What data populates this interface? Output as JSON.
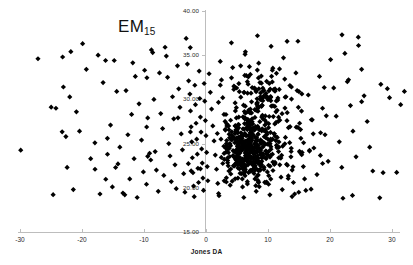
{
  "chart_data": {
    "type": "scatter",
    "title": "EM15",
    "title_base": "EM",
    "title_sub": "15",
    "xlabel": "Jones DA",
    "ylabel": "",
    "xlim": [
      -33,
      33
    ],
    "ylim": [
      15.0,
      40.0
    ],
    "grid": false,
    "legend": null,
    "marker": "diamond",
    "marker_color": "#000000",
    "marker_size_px": 2.6,
    "xticks": [
      -30,
      -20,
      -10,
      0,
      10,
      20,
      30
    ],
    "xtick_labels": [
      "-30",
      "-20",
      "-10",
      "0",
      "10",
      "20",
      "30"
    ],
    "yticks": [
      15.0,
      20.0,
      25.0,
      30.0,
      35.0,
      40.0
    ],
    "ytick_labels": [
      "15.00",
      "20.00",
      "25.00",
      "30.00",
      "35.00",
      "40.00"
    ],
    "axis_color": "#bdbdbd",
    "n_points": 812,
    "series": [
      {
        "name": "observations",
        "color": "#000000",
        "points": [
          [
            -27.1,
            34.6
          ],
          [
            -24.2,
            29.0
          ],
          [
            -23.0,
            31.4
          ],
          [
            -22.6,
            25.8
          ],
          [
            -22.4,
            22.3
          ],
          [
            -21.8,
            35.4
          ],
          [
            -21.4,
            19.8
          ],
          [
            -20.9,
            28.6
          ],
          [
            -20.4,
            26.4
          ],
          [
            -19.9,
            36.3
          ],
          [
            -19.3,
            33.4
          ],
          [
            -18.6,
            23.3
          ],
          [
            -17.9,
            22.1
          ],
          [
            -17.4,
            35.0
          ],
          [
            -17.1,
            19.3
          ],
          [
            -16.6,
            31.9
          ],
          [
            -16.2,
            34.4
          ],
          [
            -15.9,
            25.6
          ],
          [
            -15.4,
            27.1
          ],
          [
            -15.1,
            20.1
          ],
          [
            -14.8,
            34.4
          ],
          [
            -14.4,
            30.9
          ],
          [
            -14.2,
            22.7
          ],
          [
            -13.9,
            24.6
          ],
          [
            -13.4,
            19.4
          ],
          [
            -13.1,
            19.2
          ],
          [
            -12.9,
            31.0
          ],
          [
            -12.6,
            26.0
          ],
          [
            -12.3,
            21.0
          ],
          [
            -12.0,
            28.3
          ],
          [
            -11.6,
            23.3
          ],
          [
            -11.4,
            32.6
          ],
          [
            -11.1,
            18.9
          ],
          [
            -10.8,
            29.5
          ],
          [
            -10.4,
            25.4
          ],
          [
            -10.1,
            21.8
          ],
          [
            -9.9,
            33.3
          ],
          [
            -9.6,
            20.4
          ],
          [
            -9.4,
            27.9
          ],
          [
            -9.1,
            23.9
          ],
          [
            -8.8,
            35.6
          ],
          [
            -8.6,
            35.3
          ],
          [
            -8.4,
            30.0
          ],
          [
            -8.2,
            24.1
          ],
          [
            -8.0,
            22.0
          ],
          [
            -7.7,
            19.6
          ],
          [
            -7.5,
            33.0
          ],
          [
            -7.3,
            28.4
          ],
          [
            -7.0,
            26.7
          ],
          [
            -6.8,
            21.4
          ],
          [
            -6.6,
            35.9
          ],
          [
            -6.4,
            34.9
          ],
          [
            -6.2,
            32.5
          ],
          [
            -6.0,
            25.0
          ],
          [
            -5.8,
            23.6
          ],
          [
            -5.6,
            20.7
          ],
          [
            -5.4,
            30.3
          ],
          [
            -5.2,
            27.8
          ],
          [
            -5.0,
            22.6
          ],
          [
            -4.8,
            19.9
          ],
          [
            -4.6,
            33.8
          ],
          [
            -4.4,
            31.2
          ],
          [
            -4.2,
            29.1
          ],
          [
            -4.0,
            26.1
          ],
          [
            -3.8,
            24.3
          ],
          [
            -3.6,
            21.6
          ],
          [
            -3.4,
            19.5
          ],
          [
            -3.2,
            36.9
          ],
          [
            -3.0,
            34.0
          ],
          [
            -2.8,
            32.1
          ],
          [
            -2.6,
            30.6
          ],
          [
            -2.5,
            28.7
          ],
          [
            -2.4,
            26.9
          ],
          [
            -2.3,
            25.2
          ],
          [
            -2.2,
            23.4
          ],
          [
            -2.1,
            21.7
          ],
          [
            -2.0,
            20.2
          ],
          [
            -1.9,
            19.0
          ],
          [
            -1.8,
            31.6
          ],
          [
            -1.7,
            29.4
          ],
          [
            -1.6,
            27.3
          ],
          [
            -1.5,
            25.5
          ],
          [
            -1.4,
            23.8
          ],
          [
            -1.3,
            22.2
          ],
          [
            -1.2,
            20.6
          ],
          [
            -1.1,
            33.2
          ],
          [
            -1.0,
            30.1
          ],
          [
            -0.9,
            28.0
          ],
          [
            -0.8,
            26.3
          ],
          [
            -0.7,
            24.4
          ],
          [
            -0.6,
            22.8
          ],
          [
            -0.5,
            21.1
          ],
          [
            -0.4,
            19.7
          ],
          [
            -0.3,
            31.8
          ],
          [
            -0.2,
            29.8
          ],
          [
            -0.1,
            27.6
          ],
          [
            0.0,
            25.9
          ],
          [
            0.1,
            24.0
          ],
          [
            0.2,
            22.4
          ],
          [
            0.3,
            20.8
          ],
          [
            0.5,
            32.9
          ],
          [
            0.7,
            30.8
          ],
          [
            0.9,
            28.9
          ],
          [
            1.1,
            27.0
          ],
          [
            1.3,
            25.3
          ],
          [
            1.5,
            23.7
          ],
          [
            1.7,
            22.1
          ],
          [
            1.9,
            20.5
          ],
          [
            2.1,
            19.1
          ],
          [
            2.3,
            34.3
          ],
          [
            2.5,
            32.2
          ],
          [
            2.7,
            30.2
          ],
          [
            2.9,
            28.3
          ],
          [
            3.1,
            26.6
          ],
          [
            3.3,
            25.0
          ],
          [
            3.5,
            23.4
          ],
          [
            3.7,
            21.9
          ],
          [
            3.9,
            20.3
          ],
          [
            4.1,
            36.4
          ],
          [
            4.3,
            33.6
          ],
          [
            4.5,
            31.5
          ],
          [
            4.7,
            29.6
          ],
          [
            4.9,
            27.9
          ],
          [
            5.1,
            26.2
          ],
          [
            5.3,
            24.7
          ],
          [
            5.5,
            23.1
          ],
          [
            5.7,
            21.6
          ],
          [
            5.9,
            20.1
          ],
          [
            6.1,
            18.9
          ],
          [
            6.3,
            35.1
          ],
          [
            6.5,
            32.7
          ],
          [
            6.7,
            30.7
          ],
          [
            6.9,
            28.8
          ],
          [
            7.1,
            27.1
          ],
          [
            7.3,
            25.5
          ],
          [
            7.5,
            24.0
          ],
          [
            7.7,
            22.5
          ],
          [
            7.9,
            21.0
          ],
          [
            8.1,
            19.6
          ],
          [
            8.3,
            37.2
          ],
          [
            8.5,
            34.1
          ],
          [
            8.7,
            31.9
          ],
          [
            8.9,
            30.0
          ],
          [
            9.1,
            28.2
          ],
          [
            9.3,
            26.5
          ],
          [
            9.5,
            24.9
          ],
          [
            9.7,
            23.3
          ],
          [
            9.9,
            21.8
          ],
          [
            10.1,
            20.4
          ],
          [
            10.3,
            19.2
          ],
          [
            10.5,
            36.0
          ],
          [
            10.7,
            33.3
          ],
          [
            10.9,
            31.1
          ],
          [
            11.1,
            29.2
          ],
          [
            11.3,
            27.4
          ],
          [
            11.5,
            25.7
          ],
          [
            11.7,
            24.1
          ],
          [
            11.9,
            22.6
          ],
          [
            12.1,
            21.2
          ],
          [
            12.3,
            19.8
          ],
          [
            12.5,
            34.7
          ],
          [
            12.7,
            32.3
          ],
          [
            12.9,
            30.3
          ],
          [
            13.1,
            28.5
          ],
          [
            13.3,
            26.8
          ],
          [
            13.5,
            25.1
          ],
          [
            13.7,
            23.5
          ],
          [
            13.9,
            22.0
          ],
          [
            14.1,
            20.6
          ],
          [
            14.3,
            19.3
          ],
          [
            14.5,
            33.0
          ],
          [
            14.7,
            31.0
          ],
          [
            14.9,
            29.1
          ],
          [
            15.1,
            27.3
          ],
          [
            15.3,
            25.6
          ],
          [
            15.5,
            24.0
          ],
          [
            15.7,
            22.4
          ],
          [
            15.9,
            21.0
          ],
          [
            16.1,
            19.7
          ],
          [
            16.5,
            30.5
          ],
          [
            17.0,
            27.7
          ],
          [
            17.4,
            24.5
          ],
          [
            17.9,
            21.5
          ],
          [
            18.3,
            32.6
          ],
          [
            18.8,
            29.0
          ],
          [
            19.2,
            26.0
          ],
          [
            19.7,
            23.0
          ],
          [
            20.1,
            34.5
          ],
          [
            20.6,
            31.3
          ],
          [
            21.0,
            28.1
          ],
          [
            21.5,
            25.2
          ],
          [
            21.9,
            22.3
          ],
          [
            22.4,
            35.2
          ],
          [
            22.8,
            32.0
          ],
          [
            23.3,
            29.3
          ],
          [
            23.7,
            26.4
          ],
          [
            24.2,
            23.5
          ],
          [
            24.6,
            36.1
          ],
          [
            25.1,
            33.4
          ],
          [
            25.5,
            30.4
          ],
          [
            26.0,
            27.5
          ],
          [
            26.4,
            24.6
          ],
          [
            26.9,
            21.9
          ],
          [
            28.2,
            31.7
          ],
          [
            29.6,
            30.2
          ],
          [
            31.4,
            29.4
          ],
          [
            32.0,
            30.9
          ]
        ]
      }
    ]
  }
}
